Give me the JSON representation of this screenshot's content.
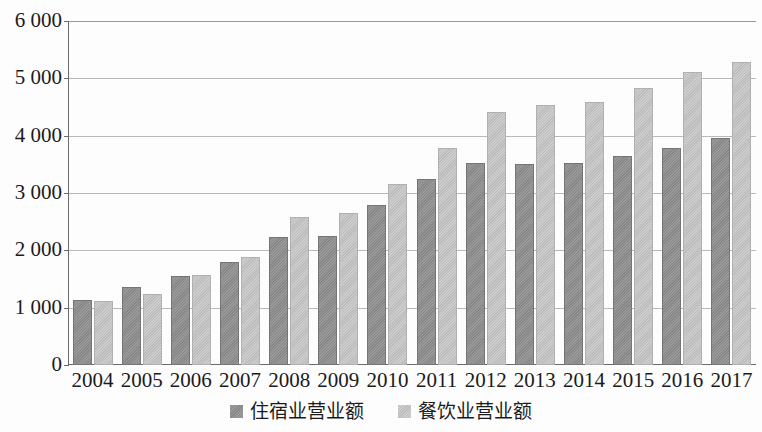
{
  "chart_data": {
    "type": "bar",
    "title": "",
    "subtitle": "",
    "xlabel": "",
    "ylabel": "",
    "categories": [
      "2004",
      "2005",
      "2006",
      "2007",
      "2008",
      "2009",
      "2010",
      "2011",
      "2012",
      "2013",
      "2014",
      "2015",
      "2016",
      "2017"
    ],
    "series": [
      {
        "name": "住宿业营业额",
        "color": "#8e8e8e",
        "values": [
          1130,
          1360,
          1550,
          1800,
          2230,
          2250,
          2790,
          3250,
          3520,
          3510,
          3520,
          3640,
          3780,
          3960
        ]
      },
      {
        "name": "餐饮业营业额",
        "color": "#c4c4c4",
        "values": [
          1120,
          1240,
          1570,
          1890,
          2590,
          2660,
          3160,
          3790,
          4420,
          4530,
          4590,
          4830,
          5110,
          5280
        ]
      }
    ],
    "ylim": [
      0,
      6000
    ],
    "ytick_values": [
      0,
      1000,
      2000,
      3000,
      4000,
      5000,
      6000
    ],
    "ytick_labels": [
      "0",
      "1 000",
      "2 000",
      "3 000",
      "4 000",
      "5 000",
      "6 000"
    ],
    "grid": true,
    "grid_axis": "y",
    "legend_position": "bottom-center",
    "bar_group_gap": true
  },
  "axes": {
    "y_axis_name": "value-axis",
    "x_axis_name": "category-axis"
  },
  "legend": {
    "items": [
      {
        "label": "住宿业营业额",
        "swatch": "dark-gray-square"
      },
      {
        "label": "餐饮业营业额",
        "swatch": "light-gray-square"
      }
    ]
  }
}
